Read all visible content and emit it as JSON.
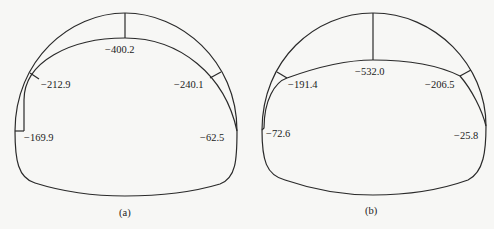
{
  "panels": [
    {
      "caption": "(a)",
      "values": {
        "crown": "−400.2",
        "left_shoulder": "−212.9",
        "right_shoulder": "−240.1",
        "left_foot": "−169.9",
        "right_foot": "−62.5"
      }
    },
    {
      "caption": "(b)",
      "values": {
        "crown": "−532.0",
        "left_shoulder": "−191.4",
        "right_shoulder": "−206.5",
        "left_foot": "−72.6",
        "right_foot": "−25.8"
      }
    }
  ]
}
